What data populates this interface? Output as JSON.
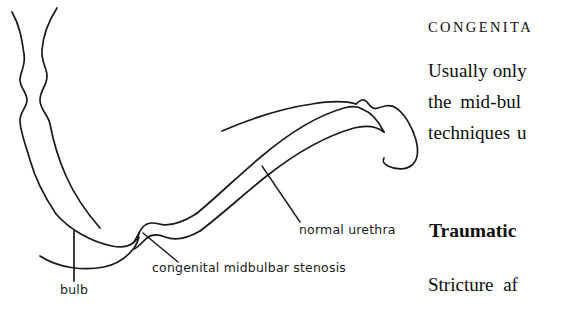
{
  "figure": {
    "name": "urethral-stricture-diagram",
    "stroke_color": "#1a1a1a",
    "labels": {
      "normal_urethra": "normal urethra",
      "congenital_midbulbar_stenosis": "congenital midbulbar stenosis",
      "bulb": "bulb"
    }
  },
  "text_column": {
    "section_heading_congenital": "CONGENITA",
    "body_lines": [
      "Usually only",
      "the mid-bul",
      "techniques u"
    ],
    "section_heading_traumatic": "Traumatic",
    "body_line_traumatic": "Stricture af"
  }
}
